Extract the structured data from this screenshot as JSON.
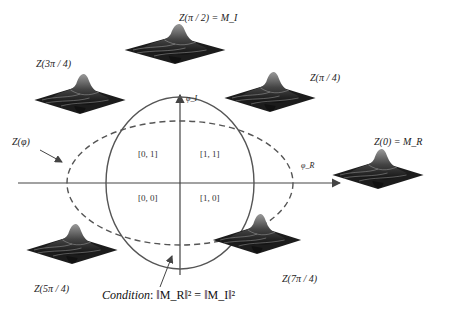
{
  "diagram": {
    "axes": {
      "horizontal_label": "φ_R",
      "vertical_label": "φ_I"
    },
    "quadrants": {
      "top_left": "[0, 1]",
      "top_right": "[1, 1]",
      "bottom_left": "[0, 0]",
      "bottom_right": "[1, 0]"
    },
    "curve_label": "Z(φ)",
    "surfaces": [
      {
        "id": "z-pi-2",
        "label": "Z(π / 2) = M_I"
      },
      {
        "id": "z-3pi-4",
        "label": "Z(3π / 4)"
      },
      {
        "id": "z-pi-4",
        "label": "Z(π / 4)"
      },
      {
        "id": "z-0",
        "label": "Z(0) = M_R"
      },
      {
        "id": "z-5pi-4",
        "label": "Z(5π / 4)"
      },
      {
        "id": "z-7pi-4",
        "label": "Z(7π / 4)"
      }
    ],
    "condition": {
      "prefix": "Condition",
      "equation": ": ‖M_R‖² = ‖M_I‖²"
    },
    "colors": {
      "line": "#555555",
      "surface_dark": "#1a1a1a",
      "surface_light": "#8a8a8a"
    }
  }
}
